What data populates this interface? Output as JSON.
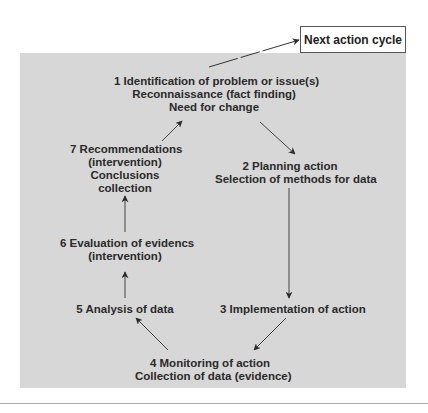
{
  "diagram": {
    "type": "action-research-cycle",
    "colors": {
      "panel": "#d7d7d7",
      "text": "#2a2a2a",
      "arrow": "#333333",
      "box_border": "#555555"
    },
    "next_cycle": {
      "label": "Next action cycle"
    },
    "steps": [
      {
        "id": 1,
        "lines": [
          "1 Identification of problem or issue(s)",
          "Reconnaissance (fact finding)",
          "Need for change"
        ]
      },
      {
        "id": 2,
        "lines": [
          "2 Planning action",
          "Selection of methods for data"
        ]
      },
      {
        "id": 3,
        "lines": [
          "3 Implementation of action"
        ]
      },
      {
        "id": 4,
        "lines": [
          "4 Monitoring of action",
          "Collection of data (evidence)"
        ]
      },
      {
        "id": 5,
        "lines": [
          "5 Analysis of data"
        ]
      },
      {
        "id": 6,
        "lines": [
          "6 Evaluation of evidencs",
          "(intervention)"
        ]
      },
      {
        "id": 7,
        "lines": [
          "7 Recommendations",
          "(intervention)",
          "Conclusions",
          "collection"
        ]
      }
    ],
    "edges": [
      {
        "from": 1,
        "to": 2
      },
      {
        "from": 2,
        "to": 3
      },
      {
        "from": 3,
        "to": 4
      },
      {
        "from": 4,
        "to": 5
      },
      {
        "from": 5,
        "to": 6
      },
      {
        "from": 6,
        "to": 7
      },
      {
        "from": 7,
        "to": 1
      },
      {
        "from": 1,
        "to": "next_cycle"
      }
    ]
  }
}
